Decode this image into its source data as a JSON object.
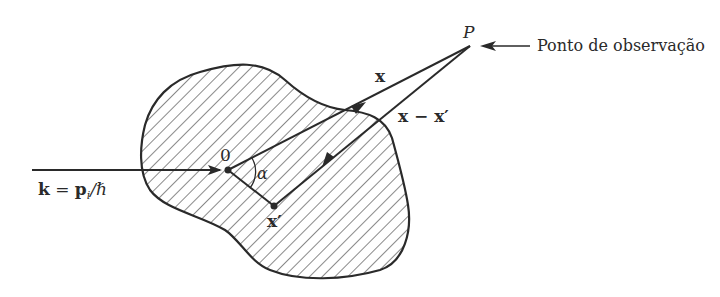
{
  "diagram": {
    "labels": {
      "observation_point": "P",
      "observation_text": "Ponto de observação",
      "vector_x": "x",
      "vector_x_minus_xprime": "x − x′",
      "origin": "0",
      "angle": "α",
      "source_point": "x′",
      "wave_vector_k": "k",
      "wave_vector_eq": " = ",
      "wave_vector_p": "p",
      "wave_vector_sub": "i",
      "wave_vector_hbar": "/ℏ"
    },
    "colors": {
      "stroke": "#2a2a2a",
      "hatch": "#3a3a3a",
      "background": "#ffffff"
    }
  }
}
